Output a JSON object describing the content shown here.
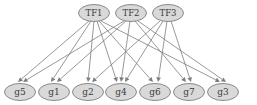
{
  "diagram": {
    "type": "directed-graph",
    "canvas": {
      "width": 257,
      "height": 105,
      "background": "#ffffff"
    },
    "style": {
      "node_fill": "#d9d9d9",
      "node_stroke": "#8a8a8a",
      "edge_color": "#7d7d7d",
      "label_color": "#3a3a3a"
    },
    "tf_nodes": [
      {
        "id": "TF1",
        "label": "TF1",
        "cx": 94,
        "cy": 13,
        "rx": 15.5,
        "ry": 8.5
      },
      {
        "id": "TF2",
        "label": "TF2",
        "cx": 131,
        "cy": 13,
        "rx": 15.5,
        "ry": 8.5
      },
      {
        "id": "TF3",
        "label": "TF3",
        "cx": 168,
        "cy": 13,
        "rx": 15.5,
        "ry": 8.5
      }
    ],
    "gene_nodes": [
      {
        "id": "g5",
        "label": "g5",
        "cx": 20,
        "cy": 92,
        "rx": 15.5,
        "ry": 8.5
      },
      {
        "id": "g1",
        "label": "g1",
        "cx": 54,
        "cy": 92,
        "rx": 15.5,
        "ry": 8.5
      },
      {
        "id": "g2",
        "label": "g2",
        "cx": 88,
        "cy": 92,
        "rx": 15.5,
        "ry": 8.5
      },
      {
        "id": "g4",
        "label": "g4",
        "cx": 121,
        "cy": 92,
        "rx": 15.5,
        "ry": 8.5
      },
      {
        "id": "g6",
        "label": "g6",
        "cx": 155,
        "cy": 92,
        "rx": 15.5,
        "ry": 8.5
      },
      {
        "id": "g7",
        "label": "g7",
        "cx": 189,
        "cy": 92,
        "rx": 15.5,
        "ry": 8.5
      },
      {
        "id": "g3",
        "label": "g3",
        "cx": 223,
        "cy": 92,
        "rx": 15.5,
        "ry": 8.5
      }
    ],
    "edges": [
      {
        "from": "TF1",
        "to": "g5",
        "from_offset": -5,
        "to_offset": -2
      },
      {
        "from": "TF1",
        "to": "g1",
        "from_offset": -3,
        "to_offset": -3
      },
      {
        "from": "TF1",
        "to": "g2",
        "from_offset": 0,
        "to_offset": 0
      },
      {
        "from": "TF1",
        "to": "g4",
        "from_offset": 3,
        "to_offset": -4
      },
      {
        "from": "TF1",
        "to": "g6",
        "from_offset": 5,
        "to_offset": -2
      },
      {
        "from": "TF1",
        "to": "g3",
        "from_offset": 7,
        "to_offset": -3
      },
      {
        "from": "TF2",
        "to": "g5",
        "from_offset": -7,
        "to_offset": 3
      },
      {
        "from": "TF2",
        "to": "g1",
        "from_offset": -5,
        "to_offset": 3
      },
      {
        "from": "TF2",
        "to": "g4",
        "from_offset": -1,
        "to_offset": 0
      },
      {
        "from": "TF2",
        "to": "g7",
        "from_offset": 4,
        "to_offset": -3
      },
      {
        "from": "TF2",
        "to": "g3",
        "from_offset": 7,
        "to_offset": 3
      },
      {
        "from": "TF3",
        "to": "g2",
        "from_offset": -8,
        "to_offset": 4
      },
      {
        "from": "TF3",
        "to": "g4",
        "from_offset": -5,
        "to_offset": 4
      },
      {
        "from": "TF3",
        "to": "g6",
        "from_offset": -1,
        "to_offset": 3
      },
      {
        "from": "TF3",
        "to": "g7",
        "from_offset": 3,
        "to_offset": 2
      }
    ]
  }
}
